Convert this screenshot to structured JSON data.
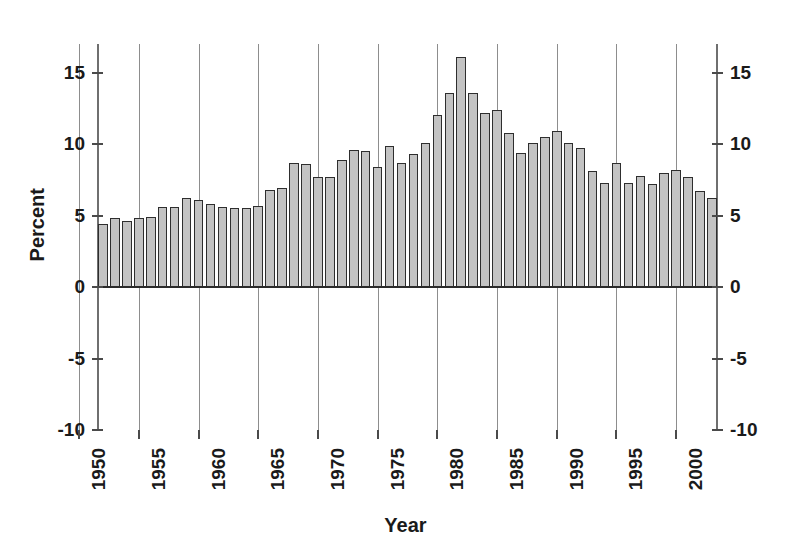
{
  "chart_data": {
    "type": "bar",
    "title": "",
    "subtitle": "",
    "xlabel": "Year",
    "ylabel": "Percent",
    "ylim": [
      -10,
      17
    ],
    "xlim": [
      1951.5,
      2003.5
    ],
    "grid": true,
    "legend": null,
    "y_ticks": [
      -10,
      -5,
      0,
      5,
      10,
      15
    ],
    "y_tick_labels": [
      "-10",
      "-5",
      "0",
      "5",
      "10",
      "15"
    ],
    "y_axis_duplicated_right": true,
    "x_ticks": [
      1950,
      1955,
      1960,
      1965,
      1970,
      1975,
      1980,
      1985,
      1990,
      1995,
      2000
    ],
    "x_tick_labels": [
      "1950",
      "1955",
      "1960",
      "1965",
      "1970",
      "1975",
      "1980",
      "1985",
      "1990",
      "1995",
      "2000"
    ],
    "x_tick_label_rotation": 90,
    "bar_fill_color": "#c3c3c3",
    "bar_edge_color": "#2e2e2e",
    "gridline_color": "#8d8d8d",
    "categories": [
      "1952",
      "1953",
      "1954",
      "1955",
      "1956",
      "1957",
      "1958",
      "1959",
      "1960",
      "1961",
      "1962",
      "1963",
      "1964",
      "1965",
      "1966",
      "1967",
      "1968",
      "1969",
      "1970",
      "1971",
      "1972",
      "1973",
      "1974",
      "1975",
      "1976",
      "1977",
      "1978",
      "1979",
      "1980",
      "1981",
      "1982",
      "1983",
      "1984",
      "1985",
      "1986",
      "1987",
      "1988",
      "1989",
      "1990",
      "1991",
      "1992",
      "1993",
      "1994",
      "1995",
      "1996",
      "1997",
      "1998",
      "1999",
      "2000",
      "2001",
      "2002",
      "2003"
    ],
    "values": [
      4.4,
      4.8,
      4.6,
      4.8,
      4.9,
      5.6,
      5.6,
      6.2,
      6.1,
      5.8,
      5.6,
      5.5,
      5.5,
      5.7,
      6.8,
      6.9,
      8.7,
      8.6,
      7.7,
      7.7,
      8.9,
      9.6,
      9.5,
      8.4,
      9.9,
      8.7,
      9.3,
      10.1,
      12.0,
      13.6,
      16.1,
      13.6,
      12.2,
      12.4,
      10.8,
      9.4,
      10.1,
      10.5,
      10.9,
      10.1,
      9.7,
      8.1,
      7.3,
      8.7,
      7.3,
      7.8,
      7.2,
      8.0,
      8.2,
      7.7,
      6.7,
      6.2
    ]
  }
}
